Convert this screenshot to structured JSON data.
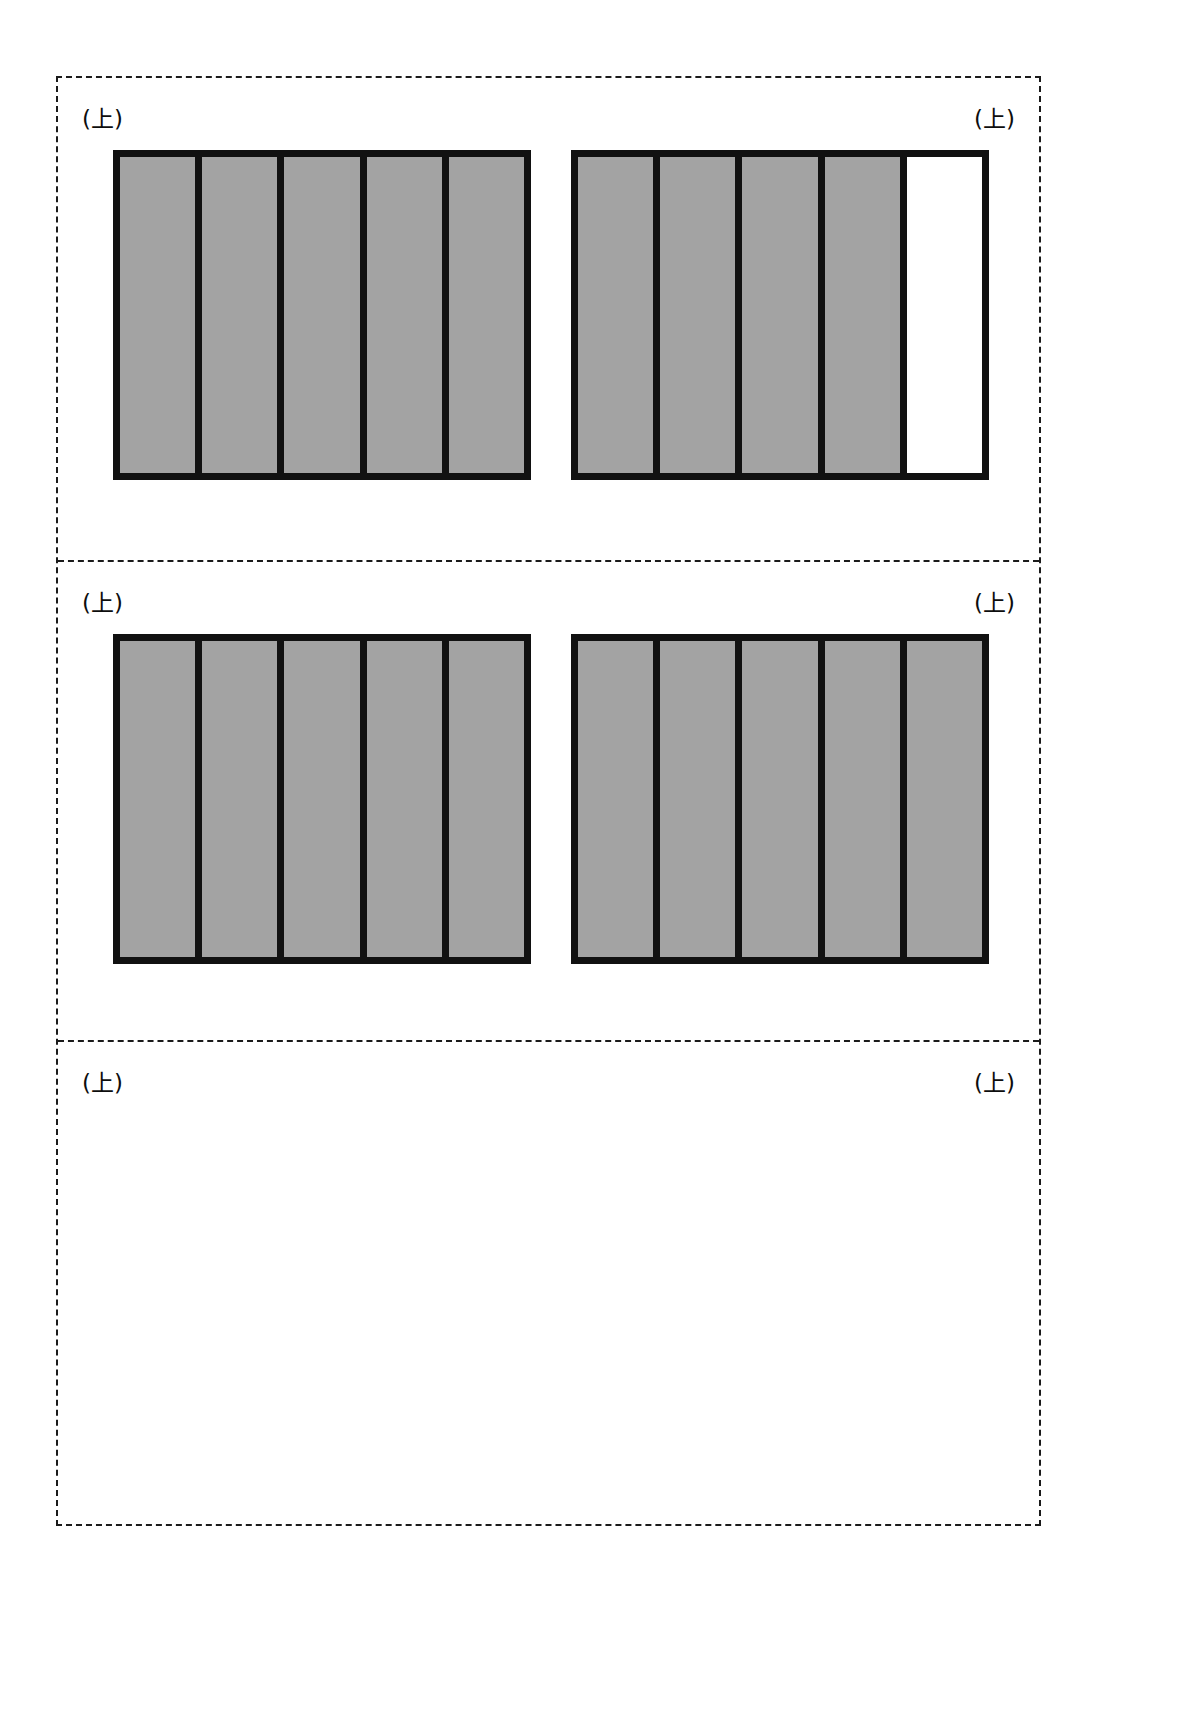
{
  "page": {
    "background_color": "#ffffff",
    "width": 1201,
    "height": 1734
  },
  "sheet": {
    "border_style": "dashed",
    "border_color": "#1a1a1a"
  },
  "colors": {
    "cell_filled": "#a3a3a3",
    "cell_empty": "#ffffff",
    "frame_black": "#111111",
    "dashed_line": "#1a1a1a"
  },
  "labels": {
    "top_marker": "(上)"
  },
  "sections": [
    {
      "id": "section-1",
      "label_left": "(上)",
      "label_right": "(上)",
      "blocks": [
        {
          "id": "block-1-left",
          "cell_count": 5,
          "cells": [
            {
              "index": 1,
              "state": "filled"
            },
            {
              "index": 2,
              "state": "filled"
            },
            {
              "index": 3,
              "state": "filled"
            },
            {
              "index": 4,
              "state": "filled"
            },
            {
              "index": 5,
              "state": "filled"
            }
          ]
        },
        {
          "id": "block-1-right",
          "cell_count": 5,
          "cells": [
            {
              "index": 1,
              "state": "filled"
            },
            {
              "index": 2,
              "state": "filled"
            },
            {
              "index": 3,
              "state": "filled"
            },
            {
              "index": 4,
              "state": "filled"
            },
            {
              "index": 5,
              "state": "empty"
            }
          ]
        }
      ]
    },
    {
      "id": "section-2",
      "label_left": "(上)",
      "label_right": "(上)",
      "blocks": [
        {
          "id": "block-2-left",
          "cell_count": 5,
          "cells": [
            {
              "index": 1,
              "state": "filled"
            },
            {
              "index": 2,
              "state": "filled"
            },
            {
              "index": 3,
              "state": "filled"
            },
            {
              "index": 4,
              "state": "filled"
            },
            {
              "index": 5,
              "state": "filled"
            }
          ]
        },
        {
          "id": "block-2-right",
          "cell_count": 5,
          "cells": [
            {
              "index": 1,
              "state": "filled"
            },
            {
              "index": 2,
              "state": "filled"
            },
            {
              "index": 3,
              "state": "filled"
            },
            {
              "index": 4,
              "state": "filled"
            },
            {
              "index": 5,
              "state": "filled"
            }
          ]
        }
      ]
    },
    {
      "id": "section-3",
      "label_left": "(上)",
      "label_right": "(上)",
      "blocks": []
    }
  ]
}
